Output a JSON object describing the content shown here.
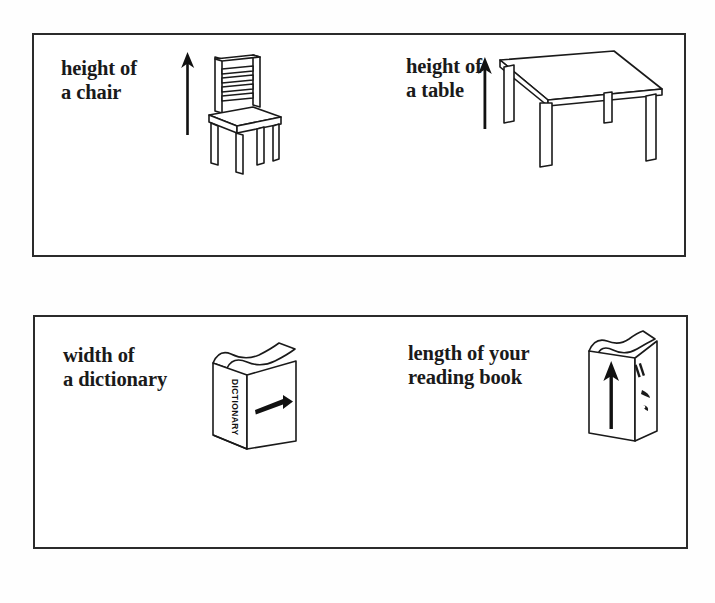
{
  "document": {
    "type": "measurement-worksheet",
    "background_color": "#fefefe",
    "ink_color": "#2b2b2b",
    "panel_count": 2
  },
  "panels": [
    {
      "id": "panel-1",
      "items": [
        {
          "id": "chair",
          "label": "height of\na chair",
          "illustration": "chair-illustration",
          "arrow": {
            "name": "up-arrow-icon",
            "direction": "up"
          }
        },
        {
          "id": "table",
          "label": "height of\na table",
          "illustration": "table-illustration",
          "arrow": {
            "name": "up-arrow-icon",
            "direction": "up"
          }
        }
      ]
    },
    {
      "id": "panel-2",
      "items": [
        {
          "id": "dictionary",
          "label": "width of\na dictionary",
          "illustration": "dictionary-book-illustration",
          "spine_text": "DICTIONARY",
          "arrow": {
            "name": "right-arrow-icon",
            "direction": "right"
          }
        },
        {
          "id": "readingbook",
          "label": "length of your\nreading book",
          "illustration": "reading-book-illustration",
          "arrow": {
            "name": "up-arrow-icon",
            "direction": "up"
          }
        }
      ]
    }
  ]
}
